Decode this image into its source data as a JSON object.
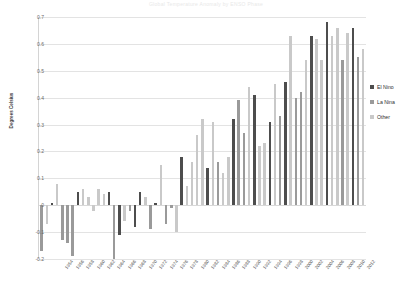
{
  "chart_data": {
    "type": "bar",
    "title": "Global Temperature Anomaly by ENSO Phase",
    "xlabel": "",
    "ylabel": "Degrees Celsius",
    "ylim": [
      -0.2,
      0.7
    ],
    "ytick_values": [
      0.7,
      0.6,
      0.5,
      0.4,
      0.3,
      0.2,
      0.1,
      0,
      -0.1,
      -0.2
    ],
    "ytick_labels": [
      "0.7",
      "0.6",
      "0.5",
      "0.4",
      "0.3",
      "0.2",
      "0.1",
      "0",
      "-0.1",
      "-0.2"
    ],
    "grid": true,
    "legend_position": "right",
    "categories": [
      "1950",
      "1951",
      "1952",
      "1953",
      "1954",
      "1955",
      "1956",
      "1957",
      "1958",
      "1959",
      "1960",
      "1961",
      "1962",
      "1963",
      "1964",
      "1965",
      "1966",
      "1967",
      "1968",
      "1969",
      "1970",
      "1971",
      "1972",
      "1973",
      "1974",
      "1975",
      "1976",
      "1977",
      "1978",
      "1979",
      "1980",
      "1981",
      "1982",
      "1983",
      "1984",
      "1985",
      "1986",
      "1987",
      "1988",
      "1989",
      "1990",
      "1991",
      "1992",
      "1993",
      "1994",
      "1995",
      "1996",
      "1997",
      "1998",
      "1999",
      "2000",
      "2001",
      "2002",
      "2003",
      "2004",
      "2005",
      "2006",
      "2007",
      "2008",
      "2009",
      "2010",
      "2011",
      "2012"
    ],
    "xtick_labels": [
      "1954",
      "1956",
      "1958",
      "1960",
      "1962",
      "1964",
      "1966",
      "1968",
      "1970",
      "1972",
      "1974",
      "1976",
      "1978",
      "1980",
      "1982",
      "1984",
      "1986",
      "1988",
      "1990",
      "1992",
      "1994",
      "1996",
      "1998",
      "2000",
      "2002",
      "2004",
      "2006",
      "2008",
      "2010",
      "2012"
    ],
    "values": [
      -0.17,
      -0.07,
      0.01,
      0.08,
      -0.13,
      -0.14,
      -0.19,
      0.05,
      0.06,
      0.03,
      -0.02,
      0.06,
      0.04,
      0.05,
      -0.2,
      -0.11,
      -0.06,
      -0.02,
      -0.08,
      0.05,
      0.03,
      -0.09,
      0.01,
      0.15,
      -0.07,
      -0.01,
      -0.1,
      0.18,
      0.07,
      0.16,
      0.26,
      0.32,
      0.14,
      0.31,
      0.16,
      0.12,
      0.18,
      0.32,
      0.39,
      0.27,
      0.44,
      0.41,
      0.22,
      0.23,
      0.31,
      0.45,
      0.33,
      0.46,
      0.63,
      0.4,
      0.42,
      0.54,
      0.63,
      0.62,
      0.54,
      0.68,
      0.63,
      0.66,
      0.54,
      0.64,
      0.66,
      0.55,
      0.58
    ],
    "phase": [
      "lanina",
      "other",
      "elnino",
      "other",
      "lanina",
      "lanina",
      "lanina",
      "elnino",
      "other",
      "other",
      "other",
      "other",
      "other",
      "elnino",
      "lanina",
      "elnino",
      "other",
      "lanina",
      "elnino",
      "elnino",
      "other",
      "lanina",
      "elnino",
      "other",
      "lanina",
      "lanina",
      "other",
      "elnino",
      "other",
      "other",
      "other",
      "other",
      "elnino",
      "other",
      "lanina",
      "other",
      "other",
      "elnino",
      "lanina",
      "lanina",
      "other",
      "elnino",
      "other",
      "other",
      "elnino",
      "other",
      "lanina",
      "elnino",
      "other",
      "lanina",
      "lanina",
      "other",
      "elnino",
      "other",
      "other",
      "elnino",
      "other",
      "other",
      "lanina",
      "other",
      "elnino",
      "lanina",
      "other"
    ],
    "series": [
      {
        "name": "El Nino",
        "color": "#4d4d4d"
      },
      {
        "name": "La Nina",
        "color": "#9a9a9a"
      },
      {
        "name": "Other",
        "color": "#c9c9c9"
      }
    ]
  },
  "legend": {
    "items": [
      {
        "label": "El Nino"
      },
      {
        "label": "La Nina"
      },
      {
        "label": "Other"
      }
    ]
  }
}
